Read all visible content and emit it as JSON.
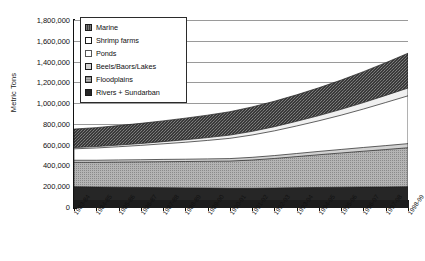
{
  "chart_data": {
    "type": "area",
    "stacked": true,
    "title": "",
    "xlabel": "",
    "ylabel": "Metric Tons",
    "ylim": [
      0,
      1800000
    ],
    "ytick_values": [
      0,
      200000,
      400000,
      600000,
      800000,
      1000000,
      1200000,
      1400000,
      1600000,
      1800000
    ],
    "ytick_labels": [
      "0",
      "200,000",
      "400,000",
      "600,000",
      "800,000",
      "1,000,000",
      "1,200,000",
      "1,400,000",
      "1,600,000",
      "1,800,000"
    ],
    "grid": true,
    "legend_position": "top-left-inside",
    "categories": [
      "1983-84",
      "1984-85",
      "1985-86",
      "1986-87",
      "1987-88",
      "1988-89",
      "1989-90",
      "1990-91",
      "1991-92",
      "1992-93",
      "1993-94",
      "1994-95",
      "1995-96",
      "1996-97",
      "1997-98",
      "1998-99"
    ],
    "stack_order_bottom_to_top": [
      "Rivers + Sundarban",
      "Floodplains",
      "Beels/Baors/Lakes",
      "Ponds",
      "Shrimp farms",
      "Marine"
    ],
    "series": [
      {
        "name": "Rivers + Sundarban",
        "fill": "#262626",
        "pattern": "solid-dark",
        "values": [
          195000,
          192000,
          190000,
          188000,
          186000,
          184000,
          182000,
          180000,
          180000,
          182000,
          185000,
          188000,
          190000,
          192000,
          193000,
          195000
        ]
      },
      {
        "name": "Floodplains",
        "fill": "#9d9d9d",
        "pattern": "fine-dot-grid",
        "values": [
          235000,
          238000,
          242000,
          246000,
          250000,
          254000,
          258000,
          262000,
          272000,
          285000,
          300000,
          315000,
          330000,
          345000,
          360000,
          375000
        ]
      },
      {
        "name": "Beels/Baors/Lakes",
        "fill": "#d2d2d2",
        "pattern": "light-gray",
        "values": [
          20000,
          20000,
          21000,
          21000,
          22000,
          22000,
          23000,
          24000,
          26000,
          28000,
          30000,
          32000,
          34000,
          36000,
          38000,
          40000
        ]
      },
      {
        "name": "Ponds",
        "fill": "#ffffff",
        "pattern": "white",
        "values": [
          110000,
          118000,
          127000,
          138000,
          150000,
          163000,
          178000,
          195000,
          215000,
          238000,
          265000,
          295000,
          330000,
          370000,
          415000,
          460000
        ]
      },
      {
        "name": "Shrimp farms",
        "fill": "#f0f0f0",
        "pattern": "white-outline",
        "values": [
          12000,
          14000,
          16000,
          18000,
          21000,
          24000,
          27000,
          31000,
          35000,
          40000,
          45000,
          50000,
          56000,
          62000,
          68000,
          75000
        ]
      },
      {
        "name": "Marine",
        "fill": "#3a3a3a",
        "pattern": "dense-hatch",
        "values": [
          178000,
          182000,
          188000,
          194000,
          200000,
          208000,
          216000,
          225000,
          235000,
          245000,
          255000,
          268000,
          282000,
          298000,
          315000,
          335000
        ]
      }
    ],
    "totals": [
      750000,
      764000,
      784000,
      805000,
      829000,
      855000,
      884000,
      917000,
      963000,
      1018000,
      1080000,
      1148000,
      1222000,
      1303000,
      1389000,
      1480000
    ]
  },
  "legend": {
    "items": [
      {
        "label": "Marine",
        "swatch": "dense-hatch"
      },
      {
        "label": "Shrimp farms",
        "swatch": "white-outline"
      },
      {
        "label": "Ponds",
        "swatch": "white"
      },
      {
        "label": "Beels/Baors/Lakes",
        "swatch": "light-gray"
      },
      {
        "label": "Floodplains",
        "swatch": "fine-dot-grid"
      },
      {
        "label": "Rivers + Sundarban",
        "swatch": "solid-dark"
      }
    ]
  }
}
